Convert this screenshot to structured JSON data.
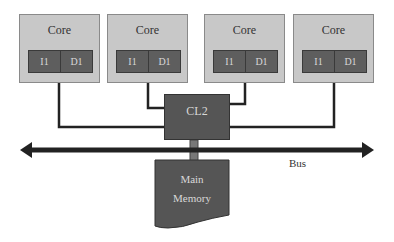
{
  "diagram": {
    "cores": [
      {
        "label": "Core",
        "caches": [
          "I1",
          "D1"
        ]
      },
      {
        "label": "Core",
        "caches": [
          "I1",
          "D1"
        ]
      },
      {
        "label": "Core",
        "caches": [
          "I1",
          "D1"
        ]
      },
      {
        "label": "Core",
        "caches": [
          "I1",
          "D1"
        ]
      }
    ],
    "shared_cache": {
      "label": "CL2"
    },
    "bus": {
      "label": "Bus"
    },
    "memory": {
      "line1": "Main",
      "line2": "Memory"
    },
    "colors": {
      "core_fill": "#c8c8c8",
      "cache_fill": "#5e5e5e",
      "cl2_fill": "#555555",
      "memory_fill": "#555555",
      "wire": "#222222"
    }
  }
}
